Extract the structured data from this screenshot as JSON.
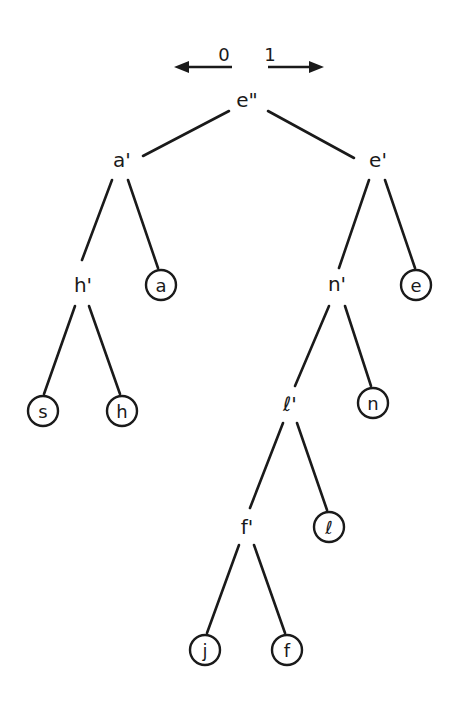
{
  "diagram": {
    "type": "binary-code-tree",
    "direction_legend": {
      "left": {
        "bit": "0",
        "arrow": "left-arrow"
      },
      "right": {
        "bit": "1",
        "arrow": "right-arrow"
      }
    },
    "internal_nodes": [
      {
        "id": "e2",
        "label": "e\"",
        "x": 247,
        "y": 100
      },
      {
        "id": "a1",
        "label": "a'",
        "x": 122,
        "y": 160
      },
      {
        "id": "e1",
        "label": "e'",
        "x": 378,
        "y": 160
      },
      {
        "id": "h1",
        "label": "h'",
        "x": 83,
        "y": 285
      },
      {
        "id": "n1",
        "label": "n'",
        "x": 337,
        "y": 284
      },
      {
        "id": "l1",
        "label": "ℓ'",
        "x": 290,
        "y": 404
      },
      {
        "id": "f1",
        "label": "f'",
        "x": 247,
        "y": 527
      }
    ],
    "leaf_nodes": [
      {
        "id": "a",
        "label": "a",
        "x": 161,
        "y": 285
      },
      {
        "id": "e",
        "label": "e",
        "x": 416,
        "y": 285
      },
      {
        "id": "s",
        "label": "s",
        "x": 43,
        "y": 411
      },
      {
        "id": "h",
        "label": "h",
        "x": 122,
        "y": 411
      },
      {
        "id": "n",
        "label": "n",
        "x": 373,
        "y": 403
      },
      {
        "id": "l",
        "label": "ℓ",
        "x": 329,
        "y": 527
      },
      {
        "id": "j",
        "label": "j",
        "x": 205,
        "y": 650
      },
      {
        "id": "f",
        "label": "f",
        "x": 287,
        "y": 650
      }
    ],
    "edges": [
      {
        "from": "e2",
        "to": "a1",
        "bit": "0"
      },
      {
        "from": "e2",
        "to": "e1",
        "bit": "1"
      },
      {
        "from": "a1",
        "to": "h1",
        "bit": "0"
      },
      {
        "from": "a1",
        "to": "a",
        "bit": "1"
      },
      {
        "from": "e1",
        "to": "n1",
        "bit": "0"
      },
      {
        "from": "e1",
        "to": "e",
        "bit": "1"
      },
      {
        "from": "h1",
        "to": "s",
        "bit": "0"
      },
      {
        "from": "h1",
        "to": "h",
        "bit": "1"
      },
      {
        "from": "n1",
        "to": "l1",
        "bit": "0"
      },
      {
        "from": "n1",
        "to": "n",
        "bit": "1"
      },
      {
        "from": "l1",
        "to": "f1",
        "bit": "0"
      },
      {
        "from": "l1",
        "to": "l",
        "bit": "1"
      },
      {
        "from": "f1",
        "to": "j",
        "bit": "0"
      },
      {
        "from": "f1",
        "to": "f",
        "bit": "1"
      }
    ]
  },
  "labels": {
    "bit_left": "0",
    "bit_right": "1",
    "root": "e\"",
    "a_prime": "a'",
    "e_prime": "e'",
    "h_prime": "h'",
    "n_prime": "n'",
    "l_prime": "ℓ'",
    "f_prime": "f'",
    "leaf_a": "a",
    "leaf_e": "e",
    "leaf_s": "s",
    "leaf_h": "h",
    "leaf_n": "n",
    "leaf_l": "ℓ",
    "leaf_j": "j",
    "leaf_f": "f"
  }
}
